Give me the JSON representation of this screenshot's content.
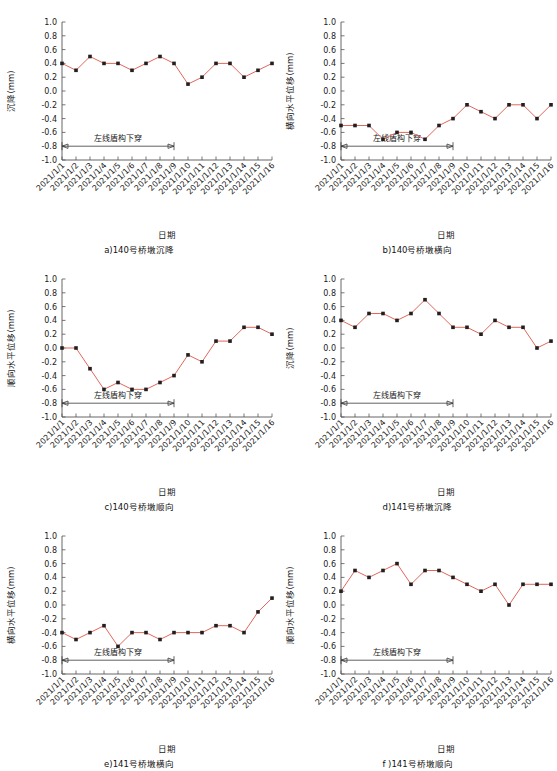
{
  "figure": {
    "axis_x_label": "日期",
    "annotation_label": "左线盾构下穿",
    "categories": [
      "2021/1/1",
      "2021/1/2",
      "2021/1/3",
      "2021/1/4",
      "2021/1/5",
      "2021/1/6",
      "2021/1/7",
      "2021/1/8",
      "2021/1/9",
      "2021/1/10",
      "2021/1/11",
      "2021/1/12",
      "2021/1/13",
      "2021/1/14",
      "2021/1/15",
      "2021/1/16"
    ],
    "ytick_labels": [
      "1.0",
      "0.8",
      "0.6",
      "0.4",
      "0.2",
      "0.0",
      "-0.2",
      "-0.4",
      "-0.6",
      "-0.8",
      "-1.0"
    ],
    "line_color": "#e2675a",
    "marker_color": "#231f20"
  },
  "chart_data": [
    {
      "id": "a",
      "type": "line",
      "title": "a)140号桥墩沉降",
      "xlabel": "日期",
      "ylabel": "沉降(mm)",
      "ylim": [
        -1.0,
        1.0
      ],
      "grid": false,
      "legend": "none",
      "annotation": "左线盾构下穿",
      "annotation_span": [
        "2021/1/1",
        "2021/1/9"
      ],
      "annotation_y": -0.8,
      "categories": [
        "2021/1/1",
        "2021/1/2",
        "2021/1/3",
        "2021/1/4",
        "2021/1/5",
        "2021/1/6",
        "2021/1/7",
        "2021/1/8",
        "2021/1/9",
        "2021/1/10",
        "2021/1/11",
        "2021/1/12",
        "2021/1/13",
        "2021/1/14",
        "2021/1/15",
        "2021/1/16"
      ],
      "values": [
        0.4,
        0.3,
        0.5,
        0.4,
        0.4,
        0.3,
        0.4,
        0.5,
        0.4,
        0.1,
        0.2,
        0.4,
        0.4,
        0.2,
        0.3,
        0.4
      ]
    },
    {
      "id": "b",
      "type": "line",
      "title": "b)140号桥墩横向",
      "xlabel": "日期",
      "ylabel": "横向水平位移(mm)",
      "ylim": [
        -1.0,
        1.0
      ],
      "grid": false,
      "legend": "none",
      "annotation": "左线盾构下穿",
      "annotation_span": [
        "2021/1/1",
        "2021/1/9"
      ],
      "annotation_y": -0.8,
      "categories": [
        "2021/1/1",
        "2021/1/2",
        "2021/1/3",
        "2021/1/4",
        "2021/1/5",
        "2021/1/6",
        "2021/1/7",
        "2021/1/8",
        "2021/1/9",
        "2021/1/10",
        "2021/1/11",
        "2021/1/12",
        "2021/1/13",
        "2021/1/14",
        "2021/1/15",
        "2021/1/16"
      ],
      "values": [
        -0.5,
        -0.5,
        -0.5,
        -0.7,
        -0.6,
        -0.6,
        -0.7,
        -0.5,
        -0.4,
        -0.2,
        -0.3,
        -0.4,
        -0.2,
        -0.2,
        -0.4,
        -0.2
      ]
    },
    {
      "id": "c",
      "type": "line",
      "title": "c)140号桥墩顺向",
      "xlabel": "日期",
      "ylabel": "顺向水平位移(mm)",
      "ylim": [
        -1.0,
        1.0
      ],
      "grid": false,
      "legend": "none",
      "annotation": "左线盾构下穿",
      "annotation_span": [
        "2021/1/1",
        "2021/1/9"
      ],
      "annotation_y": -0.8,
      "categories": [
        "2021/1/1",
        "2021/1/2",
        "2021/1/3",
        "2021/1/4",
        "2021/1/5",
        "2021/1/6",
        "2021/1/7",
        "2021/1/8",
        "2021/1/9",
        "2021/1/10",
        "2021/1/11",
        "2021/1/12",
        "2021/1/13",
        "2021/1/14",
        "2021/1/15",
        "2021/1/16"
      ],
      "values": [
        0.0,
        0.0,
        -0.3,
        -0.6,
        -0.5,
        -0.6,
        -0.6,
        -0.5,
        -0.4,
        -0.1,
        -0.2,
        0.1,
        0.1,
        0.3,
        0.3,
        0.2
      ]
    },
    {
      "id": "d",
      "type": "line",
      "title": "d)141号桥墩沉降",
      "xlabel": "日期",
      "ylabel": "沉降(mm)",
      "ylim": [
        -1.0,
        1.0
      ],
      "grid": false,
      "legend": "none",
      "annotation": "左线盾构下穿",
      "annotation_span": [
        "2021/1/1",
        "2021/1/9"
      ],
      "annotation_y": -0.8,
      "categories": [
        "2021/1/1",
        "2021/1/2",
        "2021/1/3",
        "2021/1/4",
        "2021/1/5",
        "2021/1/6",
        "2021/1/7",
        "2021/1/8",
        "2021/1/9",
        "2021/1/10",
        "2021/1/11",
        "2021/1/12",
        "2021/1/13",
        "2021/1/14",
        "2021/1/15",
        "2021/1/16"
      ],
      "values": [
        0.4,
        0.3,
        0.5,
        0.5,
        0.4,
        0.5,
        0.7,
        0.5,
        0.3,
        0.3,
        0.2,
        0.4,
        0.3,
        0.3,
        0.0,
        0.1
      ]
    },
    {
      "id": "e",
      "type": "line",
      "title": "e)141号桥墩横向",
      "xlabel": "日期",
      "ylabel": "横向水平位移(mm)",
      "ylim": [
        -1.0,
        1.0
      ],
      "grid": false,
      "legend": "none",
      "annotation": "左线盾构下穿",
      "annotation_span": [
        "2021/1/1",
        "2021/1/9"
      ],
      "annotation_y": -0.8,
      "categories": [
        "2021/1/1",
        "2021/1/2",
        "2021/1/3",
        "2021/1/4",
        "2021/1/5",
        "2021/1/6",
        "2021/1/7",
        "2021/1/8",
        "2021/1/9",
        "2021/1/10",
        "2021/1/11",
        "2021/1/12",
        "2021/1/13",
        "2021/1/14",
        "2021/1/15",
        "2021/1/16"
      ],
      "values": [
        -0.4,
        -0.5,
        -0.4,
        -0.3,
        -0.6,
        -0.4,
        -0.4,
        -0.5,
        -0.4,
        -0.4,
        -0.4,
        -0.3,
        -0.3,
        -0.4,
        -0.1,
        0.1
      ]
    },
    {
      "id": "f",
      "type": "line",
      "title": "f )141号桥墩顺向",
      "xlabel": "日期",
      "ylabel": "顺向水平位移(mm)",
      "ylim": [
        -1.0,
        1.0
      ],
      "grid": false,
      "legend": "none",
      "annotation": "左线盾构下穿",
      "annotation_span": [
        "2021/1/1",
        "2021/1/9"
      ],
      "annotation_y": -0.8,
      "categories": [
        "2021/1/1",
        "2021/1/2",
        "2021/1/3",
        "2021/1/4",
        "2021/1/5",
        "2021/1/6",
        "2021/1/7",
        "2021/1/8",
        "2021/1/9",
        "2021/1/10",
        "2021/1/11",
        "2021/1/12",
        "2021/1/13",
        "2021/1/14",
        "2021/1/15",
        "2021/1/16"
      ],
      "values": [
        0.2,
        0.5,
        0.4,
        0.5,
        0.6,
        0.3,
        0.5,
        0.5,
        0.4,
        0.3,
        0.2,
        0.3,
        0.0,
        0.3,
        0.3,
        0.3
      ]
    }
  ]
}
